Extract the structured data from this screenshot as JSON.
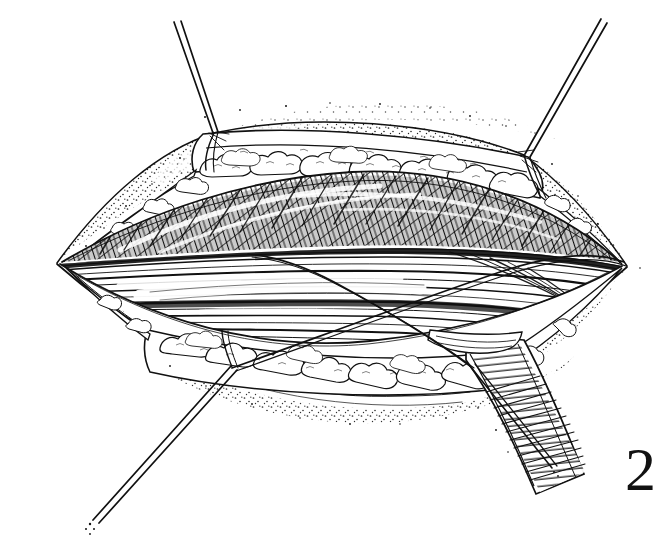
{
  "illustration": {
    "title": "Surgical exposure of incised tissue planes",
    "subject": "open-wound-cross-section",
    "figure_number": "2",
    "style": "pen-and-ink line drawing",
    "background_color": "#ffffff",
    "ink_color": "#111111",
    "canvas": {
      "width": 668,
      "height": 550
    }
  },
  "elements": {
    "skin_edge_label": "skin margin",
    "adipose_upper_label": "subcutaneous fat (upper flap)",
    "adipose_lower_label": "subcutaneous fat (lower flap)",
    "muscle_cross_hatched_label": "cross-hatched muscle belly",
    "muscle_longitudinal_label": "longitudinal muscle fibers",
    "retractor_label": "retractor band",
    "suture_upper_left_label": "traction suture upper left",
    "suture_upper_right_label": "traction suture upper right",
    "suture_lower_left_label": "traction suture lower left",
    "suture_lower_right_label": "traction suture lower right",
    "stipple_label": "stippled skin shading"
  },
  "geometry": {
    "wound_apex_left": [
      57,
      263
    ],
    "wound_apex_right": [
      627,
      266
    ],
    "suture_knot_upper_left": [
      214,
      133
    ],
    "suture_knot_upper_right": [
      524,
      155
    ],
    "suture_knot_lower_left": [
      232,
      367
    ],
    "suture_knot_lower_right": [
      470,
      368
    ],
    "suture_tip_upper_left": [
      176,
      22
    ],
    "suture_tip_upper_right": [
      600,
      20
    ],
    "suture_tip_lower_left": [
      92,
      521
    ],
    "suture_tip_lower_right": [
      556,
      470
    ]
  },
  "figure": {
    "number": "2"
  }
}
